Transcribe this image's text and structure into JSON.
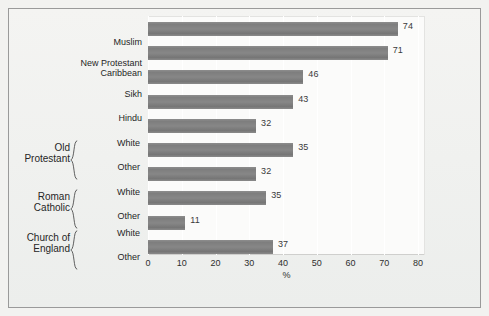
{
  "chart_data": {
    "type": "bar",
    "orientation": "horizontal",
    "title": "",
    "subtitle": "",
    "xlabel": "%",
    "ylabel": "",
    "xlim": [
      0,
      80
    ],
    "xticks": [
      0,
      10,
      20,
      30,
      40,
      50,
      60,
      70,
      80
    ],
    "xticklabels": [
      "0",
      "10",
      "20",
      "30",
      "40",
      "50",
      "60",
      "70",
      "80"
    ],
    "grid": "vertical-white",
    "legend": "none",
    "bar_color": "#808080",
    "categories": [
      "Muslim",
      "New Protestant Caribbean",
      "Sikh",
      "Hindu",
      "White",
      "Other",
      "White",
      "Other",
      "White",
      "Other"
    ],
    "values": [
      74,
      71,
      46,
      43,
      32,
      35,
      32,
      35,
      11,
      37
    ],
    "data_labels": [
      "74",
      "71",
      "46",
      "43",
      "32",
      "35",
      "32",
      "35",
      "11",
      "37"
    ],
    "bar_drawn_lengths": [
      74,
      71,
      46,
      43,
      32,
      43,
      32,
      35,
      11,
      37
    ],
    "groups": [
      {
        "label": "Old Protestant",
        "members": [
          "White",
          "Other"
        ]
      },
      {
        "label": "Roman Catholic",
        "members": [
          "White",
          "Other"
        ]
      },
      {
        "label": "Church of England",
        "members": [
          "White",
          "Other"
        ]
      }
    ]
  },
  "rows": [
    {
      "label": "Muslim",
      "sub": "",
      "value": 74,
      "drawn": 74,
      "label_text": "74"
    },
    {
      "label": "New Protestant\nCaribbean",
      "sub": "",
      "value": 71,
      "drawn": 71,
      "label_text": "71"
    },
    {
      "label": "Sikh",
      "sub": "",
      "value": 46,
      "drawn": 46,
      "label_text": "46"
    },
    {
      "label": "Hindu",
      "sub": "",
      "value": 43,
      "drawn": 43,
      "label_text": "43"
    },
    {
      "label": "",
      "sub": "White",
      "value": 32,
      "drawn": 32,
      "label_text": "32"
    },
    {
      "label": "",
      "sub": "Other",
      "value": 35,
      "drawn": 43,
      "label_text": "35"
    },
    {
      "label": "",
      "sub": "White",
      "value": 32,
      "drawn": 32,
      "label_text": "32"
    },
    {
      "label": "",
      "sub": "Other",
      "value": 35,
      "drawn": 35,
      "label_text": "35"
    },
    {
      "label": "",
      "sub": "White",
      "value": 11,
      "drawn": 11,
      "label_text": "11"
    },
    {
      "label": "",
      "sub": "Other",
      "value": 37,
      "drawn": 37,
      "label_text": "37"
    }
  ],
  "group_labels": [
    {
      "text": "Old\nProtestant"
    },
    {
      "text": "Roman\nCatholic"
    },
    {
      "text": "Church of\nEngland"
    }
  ],
  "axis": {
    "title": "%",
    "ticks": [
      "0",
      "10",
      "20",
      "30",
      "40",
      "50",
      "60",
      "70",
      "80"
    ]
  }
}
